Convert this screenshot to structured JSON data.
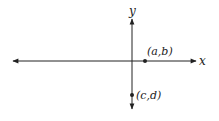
{
  "diagram": {
    "type": "coordinate-plane",
    "axes": {
      "x_label": "x",
      "y_label": "y"
    },
    "points": [
      {
        "label": "(a,b)",
        "location": "on positive x-axis"
      },
      {
        "label": "(c,d)",
        "location": "on negative y-axis"
      }
    ],
    "colors": {
      "ink": "#222222",
      "background": "#ffffff"
    }
  }
}
